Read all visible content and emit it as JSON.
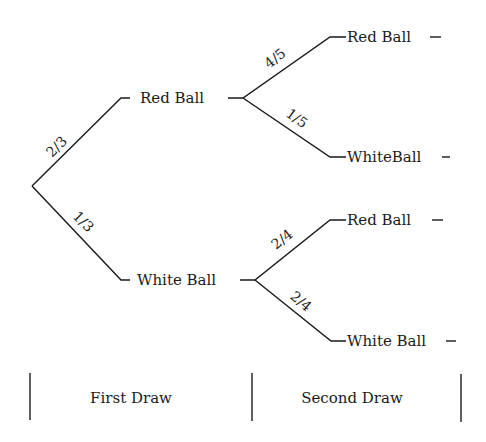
{
  "diagram": {
    "type": "probability-tree",
    "root": {
      "children": [
        {
          "label": "Red Ball",
          "probability": "2/3",
          "children": [
            {
              "label": "Red Ball",
              "probability": "4/5"
            },
            {
              "label": "WhiteBall",
              "probability": "1/5"
            }
          ]
        },
        {
          "label": "White Ball",
          "probability": "1/3",
          "children": [
            {
              "label": "Red Ball",
              "probability": "2/4"
            },
            {
              "label": "White Ball",
              "probability": "2/4"
            }
          ]
        }
      ]
    },
    "stages": [
      {
        "label": "First Draw"
      },
      {
        "label": "Second Draw"
      }
    ]
  }
}
